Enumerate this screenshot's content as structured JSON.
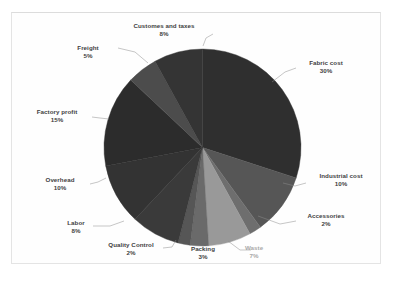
{
  "chart_data": {
    "type": "pie",
    "title": "",
    "subtitle": "",
    "xlabel": "",
    "ylabel": "",
    "legend_position": "none",
    "grid": false,
    "labels_with_percent": true,
    "start_angle_deg": 0,
    "direction": "clockwise",
    "categories": [
      "Fabric cost",
      "Industrial cost",
      "Accessories",
      "Waste",
      "Packing",
      "Quality Control",
      "Labor",
      "Overhead",
      "Factory profit",
      "Freight",
      "Customes and taxes"
    ],
    "values": [
      30,
      10,
      2,
      7,
      3,
      2,
      8,
      10,
      15,
      5,
      8
    ],
    "value_labels": [
      "30%",
      "10%",
      "2%",
      "7%",
      "3%",
      "2%",
      "8%",
      "10%",
      "15%",
      "5%",
      "8%"
    ],
    "total": 100,
    "unit": "%",
    "slices": [
      {
        "label": "Fabric cost",
        "value": 30,
        "value_label": "30%",
        "color": "#2f2f2f"
      },
      {
        "label": "Industrial cost",
        "value": 10,
        "value_label": "10%",
        "color": "#565656"
      },
      {
        "label": "Accessories",
        "value": 2,
        "value_label": "2%",
        "color": "#6e6e6e"
      },
      {
        "label": "Waste",
        "value": 7,
        "value_label": "7%",
        "color": "#999999"
      },
      {
        "label": "Packing",
        "value": 3,
        "value_label": "3%",
        "color": "#6a6a6a"
      },
      {
        "label": "Quality Control",
        "value": 2,
        "value_label": "2%",
        "color": "#565656"
      },
      {
        "label": "Labor",
        "value": 8,
        "value_label": "8%",
        "color": "#3a3a3a"
      },
      {
        "label": "Overhead",
        "value": 10,
        "value_label": "10%",
        "color": "#333333"
      },
      {
        "label": "Factory profit",
        "value": 15,
        "value_label": "15%",
        "color": "#2c2c2c"
      },
      {
        "label": "Freight",
        "value": 5,
        "value_label": "5%",
        "color": "#4c4c4c"
      },
      {
        "label": "Customes and taxes",
        "value": 8,
        "value_label": "8%",
        "color": "#343434"
      }
    ]
  },
  "labels": {
    "customes_and_taxes": {
      "name": "Customes and taxes",
      "pct": "8%"
    },
    "freight": {
      "name": "Freight",
      "pct": "5%"
    },
    "fabric_cost": {
      "name": "Fabric cost",
      "pct": "30%"
    },
    "factory_profit": {
      "name": "Factory profit",
      "pct": "15%"
    },
    "industrial_cost": {
      "name": "Industrial cost",
      "pct": "10%"
    },
    "overhead": {
      "name": "Overhead",
      "pct": "10%"
    },
    "accessories": {
      "name": "Accessories",
      "pct": "2%"
    },
    "labor": {
      "name": "Labor",
      "pct": "8%"
    },
    "quality_control": {
      "name": "Quality Control",
      "pct": "2%"
    },
    "packing": {
      "name": "Packing",
      "pct": "3%"
    },
    "waste": {
      "name": "Waste",
      "pct": "7%"
    }
  }
}
